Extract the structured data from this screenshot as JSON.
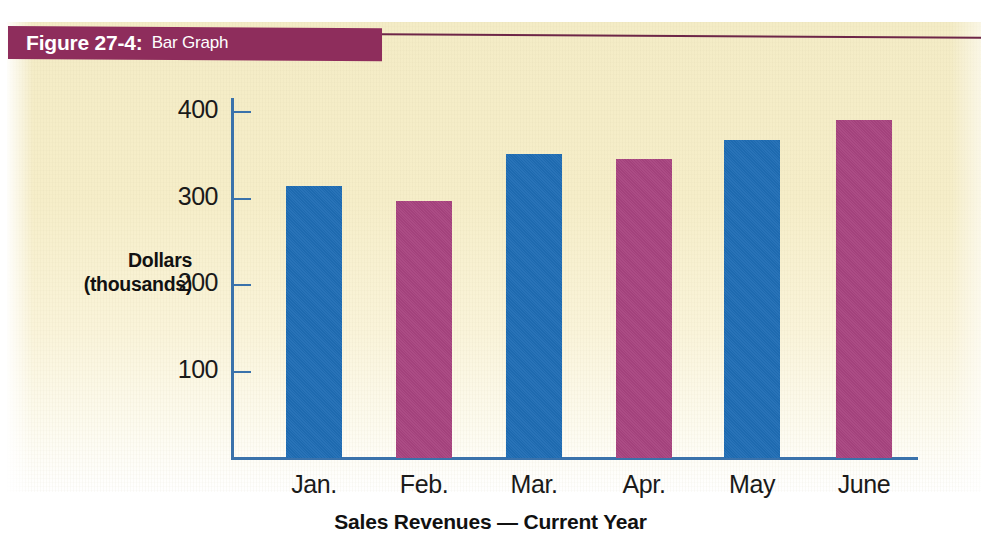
{
  "figure": {
    "label": "Figure 27-4:",
    "title": "Bar Graph"
  },
  "colors": {
    "banner": "#8e2d5c",
    "paper": "#f4ecc6",
    "axis": "#3a72ab",
    "bar_blue": "#1f6db5",
    "bar_magenta": "#a84480"
  },
  "chart_data": {
    "type": "bar",
    "title": "Sales Revenues — Current Year",
    "xlabel": "",
    "ylabel": "Dollars\n(thousands)",
    "ylabel_line1": "Dollars",
    "ylabel_line2": "(thousands)",
    "categories": [
      "Jan.",
      "Feb.",
      "Mar.",
      "Apr.",
      "May",
      "June"
    ],
    "values": [
      315,
      297,
      352,
      346,
      368,
      391
    ],
    "bar_colors": [
      "#1f6db5",
      "#a84480",
      "#1f6db5",
      "#a84480",
      "#1f6db5",
      "#a84480"
    ],
    "ylim": [
      0,
      430
    ],
    "yticks": [
      100,
      200,
      300,
      400
    ],
    "ytick_labels": [
      "100",
      "200",
      "300",
      "400"
    ],
    "grid": false,
    "legend": null
  }
}
